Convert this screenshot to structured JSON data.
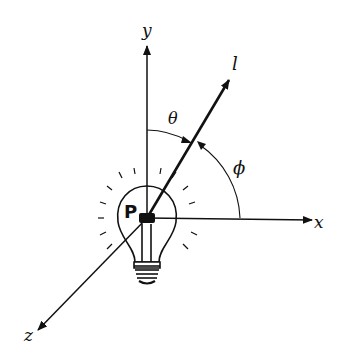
{
  "diagram": {
    "axes": {
      "x": {
        "label": "x"
      },
      "y": {
        "label": "y"
      },
      "z": {
        "label": "z"
      }
    },
    "vector": {
      "label": "l"
    },
    "point": {
      "label": "P"
    },
    "angles": {
      "theta": {
        "label": "θ"
      },
      "phi": {
        "label": "ϕ"
      }
    },
    "light_source": {
      "icon": "lightbulb-icon"
    },
    "colors": {
      "ink": "#111111",
      "background": "#ffffff"
    }
  }
}
